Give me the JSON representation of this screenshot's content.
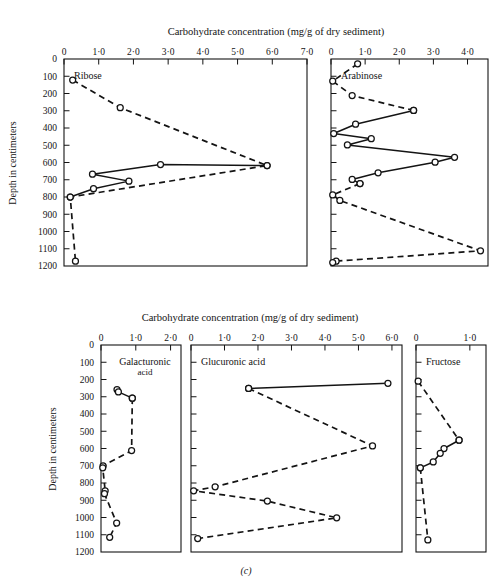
{
  "figure": {
    "caption_label": "(c)",
    "axis_title_top": "Carbohydrate concentration (mg/g of dry sediment)",
    "axis_title_bottom": "Carbohydrate concentration (mg/g of dry sediment)",
    "ylabel_top": "Depth in centimeters",
    "ylabel_bottom": "Depth in centimeters",
    "depth_ticks": [
      0,
      100,
      200,
      300,
      400,
      500,
      600,
      700,
      800,
      900,
      1000,
      1100,
      1200
    ],
    "colors": {
      "ink": "#141414",
      "background": "#ffffff"
    }
  },
  "chart_data": [
    {
      "type": "line",
      "panel": "top-left",
      "title": "Ribose",
      "xlabel": "Carbohydrate concentration (mg/g of dry sediment)",
      "ylabel": "Depth in centimeters",
      "xlim": [
        0,
        7.0
      ],
      "ylim": [
        0,
        1200
      ],
      "yinvert": true,
      "grid": false,
      "xticks": [
        0,
        1.0,
        2.0,
        3.0,
        4.0,
        5.0,
        6.0,
        7.0
      ],
      "xticklabels": [
        "0",
        "1·0",
        "2·0",
        "3·0",
        "4·0",
        "5·0",
        "6·0",
        "7·0"
      ],
      "yticks": [
        0,
        100,
        200,
        300,
        400,
        500,
        600,
        700,
        800,
        900,
        1000,
        1100,
        1200
      ],
      "series": [
        {
          "name": "dashed",
          "style": "dashed",
          "marker": "open-circle",
          "points": [
            {
              "x": 0.25,
              "depth": 122
            },
            {
              "x": 1.62,
              "depth": 282
            },
            {
              "x": 5.85,
              "depth": 618
            },
            {
              "x": 0.18,
              "depth": 800
            },
            {
              "x": 0.33,
              "depth": 1172
            }
          ]
        },
        {
          "name": "solid",
          "style": "solid",
          "marker": "open-circle",
          "points": [
            {
              "x": 5.85,
              "depth": 618
            },
            {
              "x": 2.78,
              "depth": 612
            },
            {
              "x": 0.82,
              "depth": 668
            },
            {
              "x": 1.87,
              "depth": 708
            },
            {
              "x": 0.85,
              "depth": 752
            },
            {
              "x": 0.18,
              "depth": 800
            }
          ]
        }
      ]
    },
    {
      "type": "line",
      "panel": "top-right",
      "title": "Arabinose",
      "xlabel": "Carbohydrate concentration (mg/g of dry sediment)",
      "xlim": [
        0,
        4.6
      ],
      "ylim": [
        0,
        1200
      ],
      "yinvert": true,
      "grid": false,
      "xticks": [
        0,
        1.0,
        2.0,
        3.0,
        4.0
      ],
      "xticklabels": [
        "0",
        "1·0",
        "2·0",
        "3·0",
        "4·0"
      ],
      "yticks": [
        0,
        100,
        200,
        300,
        400,
        500,
        600,
        700,
        800,
        900,
        1000,
        1100,
        1200
      ],
      "series": [
        {
          "name": "dashed-upper",
          "style": "dashed",
          "marker": "open-circle",
          "points": [
            {
              "x": 0.78,
              "depth": 28
            },
            {
              "x": 0.05,
              "depth": 128
            },
            {
              "x": 0.62,
              "depth": 212
            },
            {
              "x": 2.42,
              "depth": 298
            }
          ]
        },
        {
          "name": "solid",
          "style": "solid",
          "marker": "open-circle",
          "points": [
            {
              "x": 2.42,
              "depth": 298
            },
            {
              "x": 0.72,
              "depth": 378
            },
            {
              "x": 0.08,
              "depth": 432
            },
            {
              "x": 1.18,
              "depth": 462
            },
            {
              "x": 0.48,
              "depth": 498
            },
            {
              "x": 3.62,
              "depth": 570
            },
            {
              "x": 3.05,
              "depth": 598
            },
            {
              "x": 1.38,
              "depth": 660
            },
            {
              "x": 0.62,
              "depth": 698
            },
            {
              "x": 0.85,
              "depth": 722
            }
          ]
        },
        {
          "name": "dashed-lower",
          "style": "dashed",
          "marker": "open-circle",
          "points": [
            {
              "x": 0.85,
              "depth": 722
            },
            {
              "x": 0.05,
              "depth": 788
            },
            {
              "x": 0.26,
              "depth": 820
            },
            {
              "x": 4.38,
              "depth": 1112
            },
            {
              "x": 0.15,
              "depth": 1172
            },
            {
              "x": 0.05,
              "depth": 1180
            }
          ]
        }
      ]
    },
    {
      "type": "line",
      "panel": "bottom-left",
      "title": "Galacturonic",
      "title_line2": "acid",
      "xlabel": "Carbohydrate concentration (mg/g of dry sediment)",
      "ylabel": "Depth in centimeters",
      "xlim": [
        0,
        2.3
      ],
      "ylim": [
        0,
        1200
      ],
      "yinvert": true,
      "grid": false,
      "xticks": [
        0,
        1.0,
        2.0
      ],
      "xticklabels": [
        "0",
        "1·0",
        "2·0"
      ],
      "yticks": [
        0,
        100,
        200,
        300,
        400,
        500,
        600,
        700,
        800,
        900,
        1000,
        1100,
        1200
      ],
      "series": [
        {
          "name": "solid",
          "style": "solid",
          "marker": "open-circle",
          "points": [
            {
              "x": 0.46,
              "depth": 258
            },
            {
              "x": 0.5,
              "depth": 272
            },
            {
              "x": 0.9,
              "depth": 308
            }
          ]
        },
        {
          "name": "dashed",
          "style": "dashed",
          "marker": "open-circle",
          "points": [
            {
              "x": 0.9,
              "depth": 308
            },
            {
              "x": 0.88,
              "depth": 612
            },
            {
              "x": 0.06,
              "depth": 700
            },
            {
              "x": 0.05,
              "depth": 712
            },
            {
              "x": 0.12,
              "depth": 845
            },
            {
              "x": 0.1,
              "depth": 862
            },
            {
              "x": 0.45,
              "depth": 1032
            },
            {
              "x": 0.25,
              "depth": 1115
            }
          ]
        }
      ]
    },
    {
      "type": "line",
      "panel": "bottom-center",
      "title": "Glucuronic acid",
      "xlabel": "Carbohydrate concentration (mg/g of dry sediment)",
      "xlim": [
        0,
        6.3
      ],
      "ylim": [
        0,
        1200
      ],
      "yinvert": true,
      "grid": false,
      "xticks": [
        0,
        1.0,
        2.0,
        3.0,
        4.0,
        5.0,
        6.0
      ],
      "xticklabels": [
        "0",
        "1·0",
        "2·0",
        "3·0",
        "4·0",
        "5·0",
        "6·0"
      ],
      "yticks": [
        0,
        100,
        200,
        300,
        400,
        500,
        600,
        700,
        800,
        900,
        1000,
        1100,
        1200
      ],
      "series": [
        {
          "name": "solid",
          "style": "solid",
          "marker": "open-circle",
          "points": [
            {
              "x": 1.72,
              "depth": 252
            },
            {
              "x": 5.88,
              "depth": 222
            }
          ]
        },
        {
          "name": "dashed",
          "style": "dashed",
          "marker": "open-circle",
          "points": [
            {
              "x": 1.72,
              "depth": 252
            },
            {
              "x": 5.42,
              "depth": 585
            },
            {
              "x": 0.72,
              "depth": 822
            },
            {
              "x": 0.08,
              "depth": 845
            },
            {
              "x": 2.28,
              "depth": 905
            },
            {
              "x": 4.35,
              "depth": 1002
            },
            {
              "x": 0.2,
              "depth": 1122
            }
          ]
        }
      ]
    },
    {
      "type": "line",
      "panel": "bottom-right",
      "title": "Fructose",
      "xlabel": "Carbohydrate concentration (mg/g of dry sediment)",
      "xlim": [
        0,
        1.3
      ],
      "ylim": [
        0,
        1200
      ],
      "yinvert": true,
      "grid": false,
      "xticks": [
        0,
        1.0
      ],
      "xticklabels": [
        "0",
        "1·0"
      ],
      "yticks": [
        0,
        100,
        200,
        300,
        400,
        500,
        600,
        700,
        800,
        900,
        1000,
        1100,
        1200
      ],
      "series": [
        {
          "name": "dashed-upper",
          "style": "dashed",
          "marker": "open-circle",
          "points": [
            {
              "x": 0.04,
              "depth": 210
            },
            {
              "x": 0.8,
              "depth": 552
            }
          ]
        },
        {
          "name": "solid",
          "style": "solid",
          "marker": "open-circle",
          "points": [
            {
              "x": 0.8,
              "depth": 552
            },
            {
              "x": 0.52,
              "depth": 600
            },
            {
              "x": 0.45,
              "depth": 628
            },
            {
              "x": 0.32,
              "depth": 678
            },
            {
              "x": 0.08,
              "depth": 712
            }
          ]
        },
        {
          "name": "dashed-lower",
          "style": "dashed",
          "marker": "open-circle",
          "points": [
            {
              "x": 0.08,
              "depth": 712
            },
            {
              "x": 0.22,
              "depth": 1130
            }
          ]
        }
      ]
    }
  ]
}
